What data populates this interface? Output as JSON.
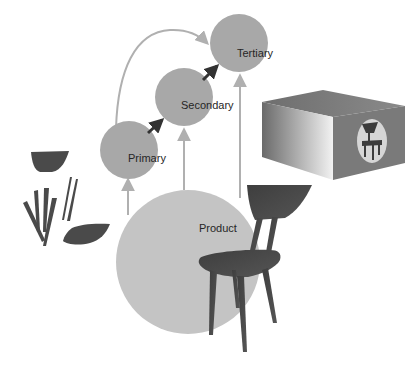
{
  "diagram": {
    "nodes": [
      {
        "id": "product",
        "label": "Product"
      },
      {
        "id": "primary",
        "label": "Primary"
      },
      {
        "id": "secondary",
        "label": "Secondary"
      },
      {
        "id": "tertiary",
        "label": "Tertiary"
      }
    ],
    "edges": [
      {
        "from": "product",
        "to": "primary",
        "style": "light"
      },
      {
        "from": "product",
        "to": "secondary",
        "style": "light"
      },
      {
        "from": "product",
        "to": "tertiary",
        "style": "light"
      },
      {
        "from": "primary",
        "to": "secondary",
        "style": "dark"
      },
      {
        "from": "secondary",
        "to": "tertiary",
        "style": "dark"
      },
      {
        "from": "primary",
        "to": "tertiary",
        "style": "light-curved"
      }
    ],
    "illustrations": {
      "chair_parts": "disassembled chair components (backrest, legs, seat)",
      "chair": "assembled chair",
      "box": "packaging box with chair emblem"
    }
  },
  "colors": {
    "node_fill": "#a8a8a8",
    "product_fill": "#c4c4c4",
    "light_arrow": "#b0b0b0",
    "dark_arrow": "#333333",
    "chair": "#4a4a4a"
  }
}
